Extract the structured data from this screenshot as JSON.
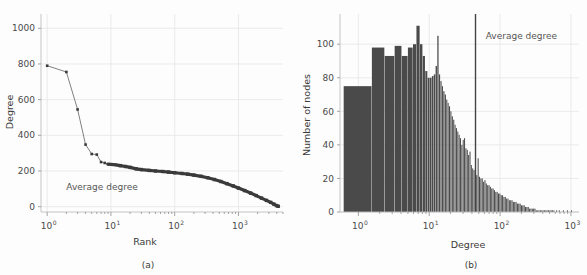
{
  "figure": {
    "background": "#fdfdfd",
    "grid_color": "#e8e8e8",
    "axis_color": "#bdbdbd",
    "series_color": "#4a4a4a",
    "bar_color": "#4a4a4a",
    "annotation_color": "#555555"
  },
  "panel_a": {
    "caption": "(a)",
    "annotation": "Average degree",
    "xlabel": "Rank",
    "ylabel": "Degree",
    "ytick_labels": [
      "0",
      "200",
      "400",
      "600",
      "800",
      "1000"
    ],
    "xtick_mantissas": [
      "10",
      "10",
      "10",
      "10"
    ],
    "xtick_exponents": [
      "0",
      "1",
      "2",
      "3"
    ]
  },
  "panel_b": {
    "caption": "(b)",
    "annotation": "Average degree",
    "xlabel": "Degree",
    "ylabel": "Number of nodes",
    "ytick_labels": [
      "0",
      "20",
      "40",
      "60",
      "80",
      "100"
    ],
    "xtick_mantissas": [
      "10",
      "10",
      "10",
      "10"
    ],
    "xtick_exponents": [
      "0",
      "1",
      "2",
      "3"
    ]
  },
  "chart_data": [
    {
      "type": "line",
      "panel": "(a)",
      "title": "",
      "xlabel": "Rank",
      "ylabel": "Degree",
      "xscale": "log",
      "yscale": "linear",
      "xlim": [
        0.8,
        5000
      ],
      "ylim": [
        -30,
        1080
      ],
      "yticks": [
        0,
        200,
        400,
        600,
        800,
        1000
      ],
      "xticks": [
        1,
        10,
        100,
        1000
      ],
      "grid": true,
      "marker": "square",
      "annotations": [
        {
          "text": "Average degree",
          "x": 2.0,
          "y": 100
        }
      ],
      "x": [
        1,
        2,
        3,
        4,
        5,
        6,
        7,
        8,
        9,
        10,
        12,
        14,
        17,
        20,
        25,
        30,
        40,
        50,
        65,
        80,
        100,
        130,
        160,
        200,
        260,
        330,
        420,
        530,
        660,
        830,
        1000,
        1250,
        1550,
        1900,
        2300,
        2750,
        3200,
        3600,
        3950,
        4200
      ],
      "y": [
        790,
        755,
        545,
        348,
        295,
        292,
        250,
        245,
        238,
        237,
        234,
        230,
        225,
        220,
        212,
        208,
        203,
        200,
        197,
        194,
        190,
        186,
        182,
        177,
        170,
        162,
        152,
        141,
        129,
        116,
        104,
        90,
        76,
        62,
        48,
        35,
        24,
        14,
        6,
        2
      ]
    },
    {
      "type": "bar",
      "panel": "(b)",
      "title": "",
      "xlabel": "Degree",
      "ylabel": "Number of nodes",
      "xscale": "log",
      "yscale": "linear",
      "xlim": [
        0.55,
        1300
      ],
      "ylim": [
        0,
        118
      ],
      "yticks": [
        0,
        20,
        40,
        60,
        80,
        100
      ],
      "xticks": [
        1,
        10,
        100,
        1000
      ],
      "grid": true,
      "annotations": [
        {
          "text": "Average degree",
          "x": 200,
          "y": 103
        }
      ],
      "vline": {
        "x": 45,
        "label": "Average degree"
      },
      "bin_left_edges": [
        0.62,
        1.55,
        2.35,
        3.25,
        4.1,
        5.0,
        5.9,
        6.6,
        7.4,
        8.1,
        8.8,
        9.5,
        10.2,
        10.9,
        11.6,
        12.3,
        13.0,
        13.7,
        14.4,
        15.1,
        15.8,
        16.6,
        17.4,
        18.2,
        19.0,
        19.9,
        20.8,
        21.8,
        22.8,
        23.8,
        24.9,
        26.0,
        27.2,
        28.4,
        29.7,
        31.0,
        32.4,
        33.9,
        35.4,
        37.0,
        38.7,
        40.4,
        42.2,
        44.1,
        46.1,
        48.2,
        50.4,
        52.7,
        55.1,
        57.6,
        60.2,
        62.9,
        65.7,
        68.7,
        71.8,
        75.0,
        78.4,
        81.9,
        85.6,
        89.5,
        93.5,
        97.7,
        102.1,
        106.7,
        111.5,
        116.5,
        121.7,
        127.2,
        132.9,
        138.9,
        145.1,
        151.6,
        158.4,
        165.5,
        172.9,
        180.7,
        188.8,
        197.3,
        206.1,
        215.4,
        225.0,
        235.1,
        245.7,
        256.7,
        268.2,
        280.2,
        292.8,
        305.9,
        319.6,
        333.9,
        348.9,
        364.6,
        381.0,
        398.1,
        416.0,
        434.7,
        454.3,
        474.7,
        496.0,
        518.3,
        541.6,
        566.0,
        591.4,
        618.0,
        645.8,
        674.8,
        705.1,
        736.8,
        770.0,
        804.6,
        840.8,
        878.6,
        918.1,
        959.4,
        1002.5
      ],
      "bin_right_edges": [
        1.55,
        2.35,
        3.25,
        4.1,
        5.0,
        5.9,
        6.6,
        7.4,
        8.1,
        8.8,
        9.5,
        10.2,
        10.9,
        11.6,
        12.3,
        13.0,
        13.7,
        14.4,
        15.1,
        15.8,
        16.6,
        17.4,
        18.2,
        19.0,
        19.9,
        20.8,
        21.8,
        22.8,
        23.8,
        24.9,
        26.0,
        27.2,
        28.4,
        29.7,
        31.0,
        32.4,
        33.9,
        35.4,
        37.0,
        38.7,
        40.4,
        42.2,
        44.1,
        46.1,
        48.2,
        50.4,
        52.7,
        55.1,
        57.6,
        60.2,
        62.9,
        65.7,
        68.7,
        71.8,
        75.0,
        78.4,
        81.9,
        85.6,
        89.5,
        93.5,
        97.7,
        102.1,
        106.7,
        111.5,
        116.5,
        121.7,
        127.2,
        132.9,
        138.9,
        145.1,
        151.6,
        158.4,
        165.5,
        172.9,
        180.7,
        188.8,
        197.3,
        206.1,
        215.4,
        225.0,
        235.1,
        245.7,
        256.7,
        268.2,
        280.2,
        292.8,
        305.9,
        319.6,
        333.9,
        348.9,
        364.6,
        381.0,
        398.1,
        416.0,
        434.7,
        454.3,
        474.7,
        496.0,
        518.3,
        541.6,
        566.0,
        591.4,
        618.0,
        645.8,
        674.8,
        705.1,
        736.8,
        770.0,
        804.6,
        840.8,
        878.6,
        918.1,
        959.4,
        1002.5,
        1047.6
      ],
      "counts": [
        75,
        98,
        93,
        99,
        93,
        98,
        100,
        111,
        100,
        93,
        84,
        80,
        80,
        81,
        82,
        87,
        105,
        82,
        78,
        75,
        72,
        70,
        67,
        65,
        63,
        60,
        57,
        55,
        52,
        50,
        48,
        46,
        44,
        40,
        43,
        44,
        38,
        37,
        34,
        36,
        28,
        26,
        25,
        26,
        22,
        32,
        21,
        20,
        20,
        18,
        19,
        17,
        16,
        16,
        15,
        14,
        14,
        13,
        12,
        12,
        11,
        11,
        10,
        10,
        9,
        9,
        8,
        8,
        7,
        7,
        7,
        6,
        6,
        6,
        5,
        5,
        5,
        4,
        4,
        4,
        3,
        3,
        3,
        2,
        2,
        2,
        2,
        2,
        1,
        1,
        1,
        1,
        1,
        1,
        1,
        1,
        1,
        1,
        1,
        1,
        1,
        1,
        0,
        1,
        0,
        1,
        0,
        0,
        1,
        0,
        0,
        1,
        0,
        0,
        1,
        0
      ]
    }
  ]
}
